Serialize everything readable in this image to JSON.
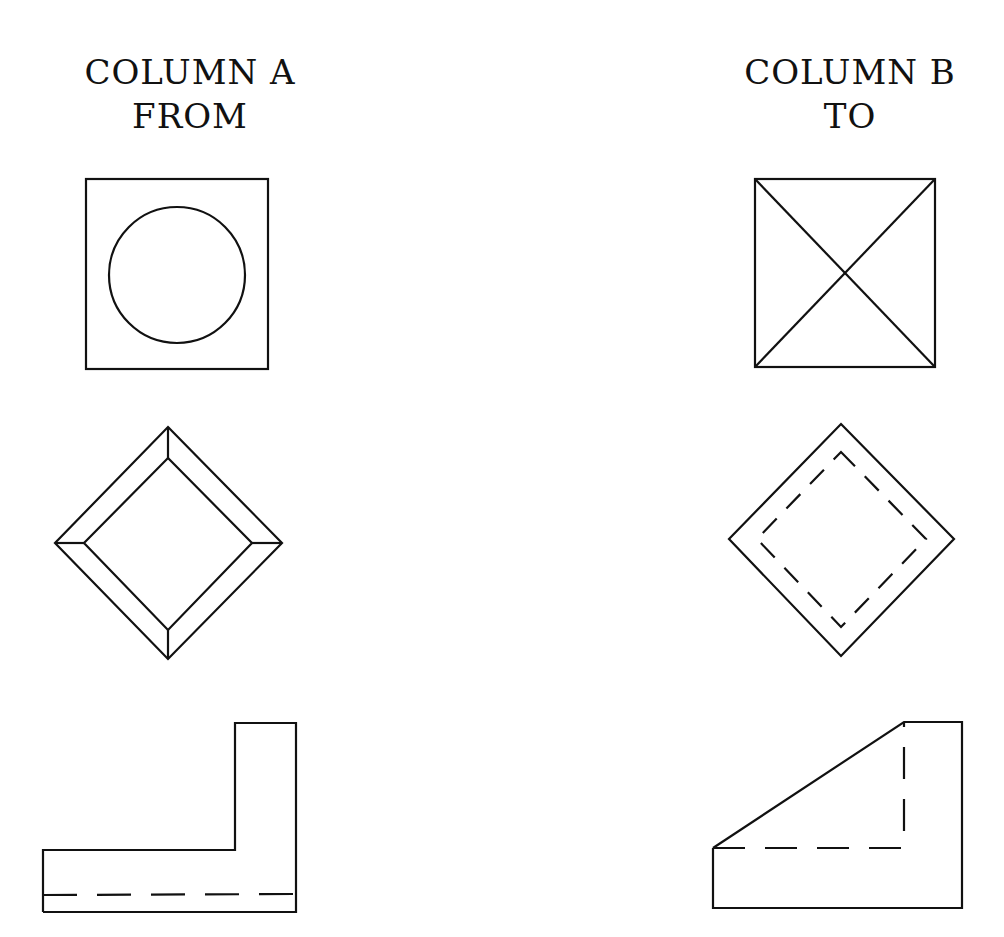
{
  "column_a": {
    "title": "COLUMN A",
    "subtitle": "FROM",
    "figures": [
      {
        "name": "circle-in-square",
        "description": "square with inscribed circle"
      },
      {
        "name": "beveled-diamond",
        "description": "diamond with inner diamond joined at corners (beveled frame)"
      },
      {
        "name": "l-shape",
        "description": "L-shaped profile with hidden dashed line near bottom"
      }
    ]
  },
  "column_b": {
    "title": "COLUMN B",
    "subtitle": "TO",
    "figures": [
      {
        "name": "square-with-diagonals",
        "description": "square with both diagonals (X)"
      },
      {
        "name": "diamond-with-hidden-inner",
        "description": "diamond with dashed inner diamond"
      },
      {
        "name": "wedge-shape",
        "description": "sloped wedge profile with hidden dashed L lines"
      }
    ]
  }
}
